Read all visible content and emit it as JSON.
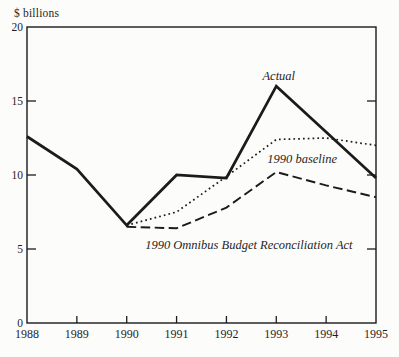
{
  "figure": {
    "background": "#fcfcfa",
    "ink": "#1b1b1b",
    "text_color": "#1f1f1f"
  },
  "chart_data": {
    "type": "line",
    "title": "",
    "ylabel": "$ billions",
    "xlabel": "",
    "xlim": [
      1988,
      1995
    ],
    "ylim": [
      0,
      20
    ],
    "yticks": [
      0,
      5,
      10,
      15,
      20
    ],
    "ytick_marks": [
      5,
      10,
      15
    ],
    "xticks": [
      1988,
      1989,
      1990,
      1991,
      1992,
      1993,
      1994,
      1995
    ],
    "xtick_marks": [
      1989,
      1990,
      1991,
      1992,
      1993,
      1994
    ],
    "grid": false,
    "legend_position": "inline-annotations",
    "series": [
      {
        "name": "Actual",
        "line_style": "solid",
        "line_width": 2.7,
        "points": [
          [
            1988,
            12.6
          ],
          [
            1989,
            10.4
          ],
          [
            1990,
            6.6
          ],
          [
            1991,
            10.0
          ],
          [
            1992,
            9.8
          ],
          [
            1993,
            16.0
          ],
          [
            1994,
            12.9
          ],
          [
            1995,
            9.8
          ]
        ]
      },
      {
        "name": "1990 baseline",
        "line_style": "dotted",
        "line_width": 1.7,
        "points": [
          [
            1990,
            6.6
          ],
          [
            1991,
            7.5
          ],
          [
            1992,
            9.9
          ],
          [
            1993,
            12.4
          ],
          [
            1994,
            12.5
          ],
          [
            1995,
            12.0
          ]
        ]
      },
      {
        "name": "1990 Omnibus Budget Reconciliation Act",
        "line_style": "dashed",
        "line_width": 1.9,
        "points": [
          [
            1990,
            6.5
          ],
          [
            1991,
            6.4
          ],
          [
            1992,
            7.8
          ],
          [
            1993,
            10.2
          ],
          [
            1994,
            9.3
          ],
          [
            1995,
            8.5
          ]
        ]
      }
    ],
    "annotations": [
      {
        "text": "Actual",
        "x": 1993.05,
        "y": 16.4
      },
      {
        "text": "1990 baseline",
        "x": 1993.52,
        "y": 10.8
      },
      {
        "text": "1990 Omnibus Budget Reconciliation Act",
        "x": 1992.45,
        "y": 5.0
      }
    ]
  }
}
